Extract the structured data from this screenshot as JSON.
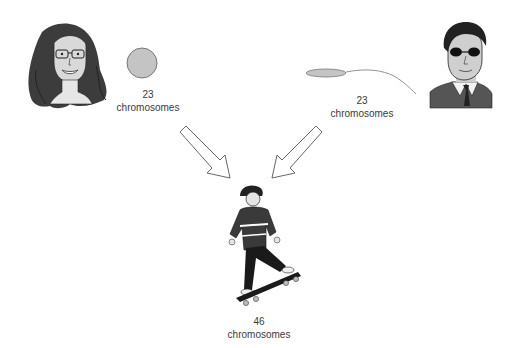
{
  "diagram": {
    "mother": {
      "figure": "woman-with-glasses-portrait",
      "gamete": "egg-cell",
      "count": "23",
      "unit": "chromosomes"
    },
    "father": {
      "figure": "man-with-sunglasses-portrait",
      "gamete": "sperm-cell",
      "count": "23",
      "unit": "chromosomes"
    },
    "child": {
      "figure": "child-on-skateboard",
      "count": "46",
      "unit": "chromosomes"
    },
    "arrows": [
      {
        "from": "mother",
        "to": "child",
        "direction": "down-right"
      },
      {
        "from": "father",
        "to": "child",
        "direction": "down-left"
      }
    ],
    "colors": {
      "gamete_fill": "#c4c4c4",
      "gamete_stroke": "#777777",
      "arrow_stroke": "#666666",
      "hair": "#3c3c3c",
      "skin": "#d9d9d9",
      "text": "#3a3a3a"
    }
  }
}
